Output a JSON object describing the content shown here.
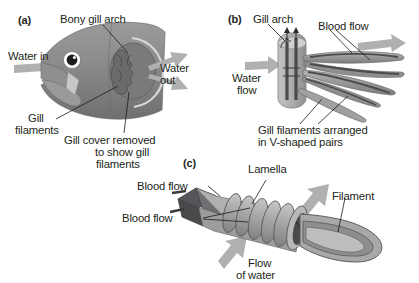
{
  "figure": {
    "background_color": "#ffffff",
    "body_gray": "#8a8a8a",
    "arrow_gray": "#a9a9a9",
    "dark_gray": "#58585a",
    "text_color": "#231f20"
  },
  "panels": {
    "a": {
      "letter": "(a)",
      "caption": "Fish head showing gill chamber with gill cover removed",
      "labels": {
        "water_in": "Water in",
        "bony_gill_arch": "Bony gill arch",
        "water_out_line1": "Water",
        "water_out_line2": "out",
        "gill_filaments_line1": "Gill",
        "gill_filaments_line2": "filaments",
        "gill_cover_line1": "Gill cover removed",
        "gill_cover_line2": "to show gill",
        "gill_cover_line3": "filaments"
      }
    },
    "b": {
      "letter": "(b)",
      "caption": "Gill arch with filaments in V-shaped pairs",
      "labels": {
        "gill_arch": "Gill arch",
        "blood_flow": "Blood flow",
        "water_flow_line1": "Water",
        "water_flow_line2": "flow",
        "v_pairs_line1": "Gill filaments arranged",
        "v_pairs_line2": "in V-shaped pairs"
      }
    },
    "c": {
      "letter": "(c)",
      "caption": "Single gill filament with lamellae",
      "labels": {
        "lamella": "Lamella",
        "blood_flow_upper": "Blood flow",
        "blood_flow_lower": "Blood flow",
        "filament": "Filament",
        "flow_of_water_line1": "Flow",
        "flow_of_water_line2": "of water"
      }
    }
  }
}
